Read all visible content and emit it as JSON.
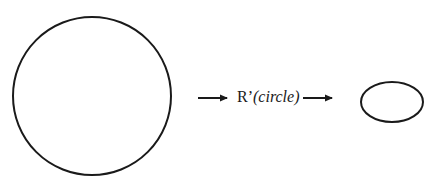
{
  "diagram": {
    "source_shape": {
      "type": "circle",
      "cx": 92,
      "cy": 96,
      "r": 79,
      "stroke": "#1a1a1a",
      "stroke_width": 2
    },
    "target_shape": {
      "type": "ellipse",
      "cx": 392,
      "cy": 102,
      "rx": 31,
      "ry": 20,
      "stroke": "#1a1a1a",
      "stroke_width": 2
    },
    "arrows": [
      {
        "x1": 198,
        "y1": 98,
        "x2": 231,
        "y2": 98
      },
      {
        "x1": 303,
        "y1": 98,
        "x2": 336,
        "y2": 98
      }
    ],
    "label": {
      "function": "R’",
      "argument": "(circle)"
    }
  }
}
